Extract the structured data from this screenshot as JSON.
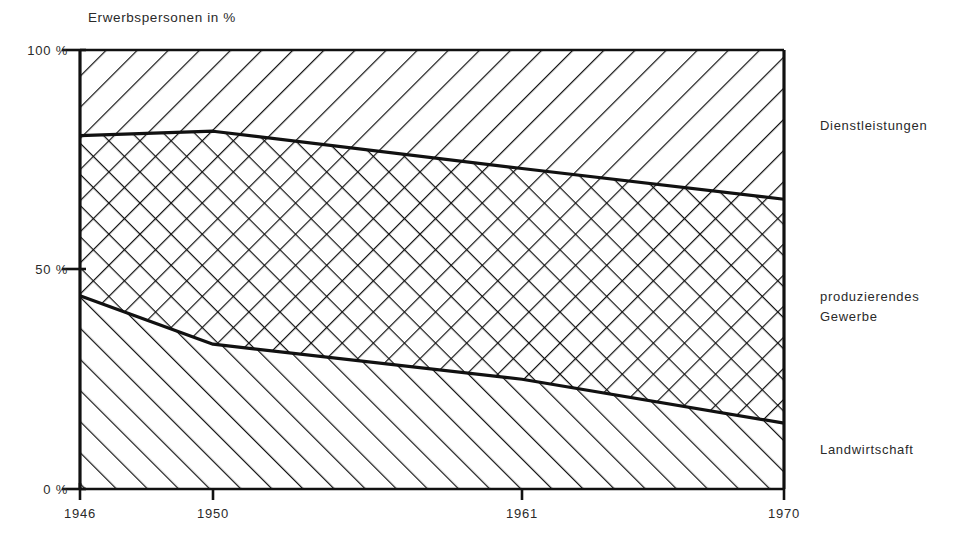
{
  "chart_data": {
    "type": "area",
    "title": "Erwerbspersonen in  %",
    "xlabel": "",
    "ylabel": "Erwerbspersonen in %",
    "xlim": [
      1946,
      1970
    ],
    "ylim": [
      0,
      100
    ],
    "grid": false,
    "stacked": true,
    "legend_position": "right-outside",
    "x": [
      1946,
      1950,
      1961,
      1970
    ],
    "xticks": [
      "1946",
      "1950",
      "1961",
      "1970"
    ],
    "yticks": [
      "0 %",
      "50 %",
      "100 %"
    ],
    "ytick_values": [
      0,
      50,
      100
    ],
    "series": [
      {
        "name": "Landwirtschaft",
        "hatch": "forward-slash",
        "values": [
          44,
          33,
          25,
          15
        ],
        "band_lower": [
          0,
          0,
          0,
          0
        ],
        "band_upper": [
          44,
          33,
          25,
          15
        ]
      },
      {
        "name": "produzierendes Gewerbe",
        "hatch": "cross-hatch",
        "values": [
          36.5,
          48.5,
          48,
          51
        ],
        "band_lower": [
          44,
          33,
          25,
          15
        ],
        "band_upper": [
          80.5,
          81.5,
          73,
          66
        ]
      },
      {
        "name": "Dienstleistungen",
        "hatch": "back-slash",
        "values": [
          19.5,
          18.5,
          27,
          34
        ],
        "band_lower": [
          80.5,
          81.5,
          73,
          66
        ],
        "band_upper": [
          100,
          100,
          100,
          100
        ]
      }
    ],
    "boundary_upper_curve": [
      80.5,
      81.5,
      73,
      66
    ],
    "boundary_lower_curve": [
      44,
      33,
      25,
      15
    ],
    "colors": {
      "ink": "#111111",
      "background": "#ffffff",
      "text": "#2a2a2a"
    }
  },
  "labels": {
    "axis_title": "Erwerbspersonen in  %",
    "y_100": "100 %",
    "y_50": "50 %",
    "y_0": "0 %",
    "x_1946": "1946",
    "x_1950": "1950",
    "x_1961": "1961",
    "x_1970": "1970",
    "series_top": "Dienstleistungen",
    "series_middle": "produzierendes\nGewerbe",
    "series_bottom": "Landwirtschaft"
  }
}
